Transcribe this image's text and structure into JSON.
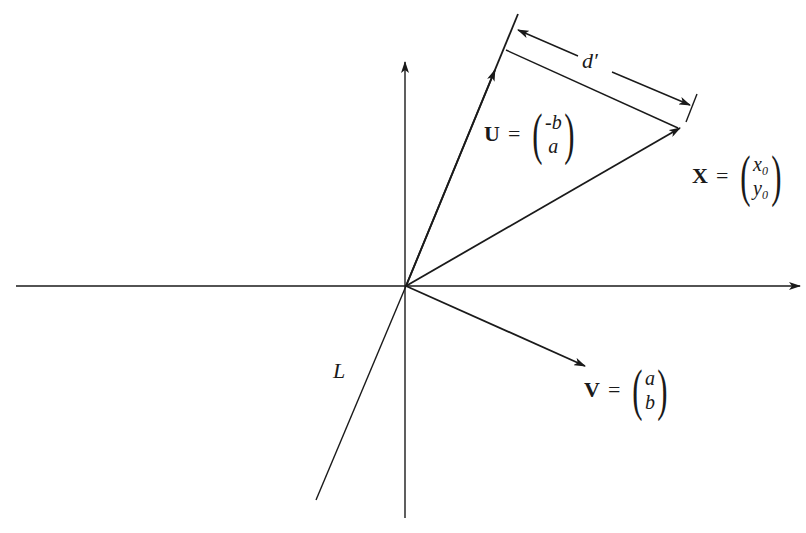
{
  "diagram": {
    "type": "vector-projection-diagram",
    "colors": {
      "ink": "#1a1a1a",
      "background": "#ffffff"
    },
    "origin": [
      406,
      286
    ],
    "axes": {
      "horizontal": {
        "from": [
          16,
          286
        ],
        "to": [
          800,
          286
        ],
        "arrow": "right"
      },
      "vertical": {
        "from": [
          405,
          518
        ],
        "to": [
          405,
          62
        ],
        "arrow": "up"
      }
    },
    "line_L": {
      "label": "L",
      "from": [
        316,
        500
      ],
      "to": [
        406,
        286
      ]
    },
    "vectors": {
      "U": {
        "name": "U",
        "equals": "=",
        "components": [
          "-b",
          "a"
        ],
        "from": [
          406,
          286
        ],
        "to": [
          518,
          14
        ]
      },
      "X": {
        "name": "X",
        "equals": "=",
        "components": [
          "x₀",
          "y₀"
        ],
        "from": [
          406,
          286
        ],
        "to": [
          680,
          128
        ]
      },
      "V": {
        "name": "V",
        "equals": "=",
        "components": [
          "a",
          "b"
        ],
        "from": [
          406,
          286
        ],
        "to": [
          585,
          366
        ]
      }
    },
    "distance": {
      "label": "d′",
      "perpendicular_from": [
        506,
        50
      ],
      "perpendicular_to": [
        680,
        128
      ]
    }
  }
}
